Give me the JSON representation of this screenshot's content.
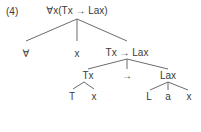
{
  "example_number": "(4)",
  "tree": {
    "root": "∀x(Tx → Lax)",
    "level1": [
      "∀",
      "x",
      "Tx → Lax"
    ],
    "level2": [
      "Tx",
      "→",
      "Lax"
    ],
    "tx_children": [
      "T",
      "x"
    ],
    "lax_children": [
      "L",
      "a",
      "x"
    ]
  }
}
